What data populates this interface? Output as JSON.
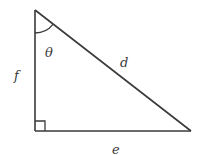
{
  "diagram": {
    "type": "right-triangle",
    "vertices": {
      "top": [
        35,
        10
      ],
      "right_angle": [
        35,
        131
      ],
      "right": [
        191,
        131
      ]
    },
    "sides": {
      "vertical": {
        "label": "f"
      },
      "hypotenuse": {
        "label": "d"
      },
      "horizontal": {
        "label": "e"
      }
    },
    "angle": {
      "label": "θ",
      "at_vertex": "top"
    },
    "right_angle_marker": true,
    "colors": {
      "stroke": "#3a3a3a",
      "background": "#ffffff"
    }
  }
}
